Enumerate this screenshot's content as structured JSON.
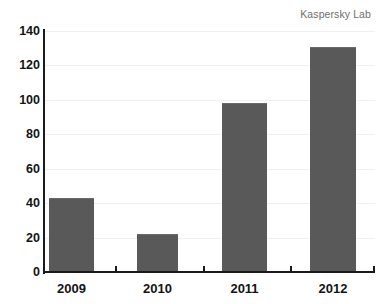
{
  "attribution": "Kaspersky Lab",
  "chart_data": {
    "type": "bar",
    "title": "",
    "subtitle": "",
    "xlabel": "",
    "ylabel": "",
    "categories": [
      "2009",
      "2010",
      "2011",
      "2012"
    ],
    "values": [
      43,
      22,
      98,
      131
    ],
    "series": [
      {
        "name": "",
        "values": [
          43,
          22,
          98,
          131
        ]
      }
    ],
    "ylim": [
      0,
      140
    ],
    "yticks": [
      0,
      20,
      40,
      60,
      80,
      100,
      120,
      140
    ],
    "ytick_labels": [
      "0",
      "20",
      "40",
      "60",
      "80",
      "100",
      "120",
      "140"
    ],
    "grid": true,
    "grid_axis": "y",
    "legend": false,
    "legend_position": "none",
    "annotations": [
      "Kaspersky Lab"
    ],
    "bar_color": "#595959",
    "gridline_color": "#f0f0f2",
    "axis_color": "#1a1a1a",
    "background_color": "#ffffff",
    "attribution_color": "#6f6f6f"
  }
}
